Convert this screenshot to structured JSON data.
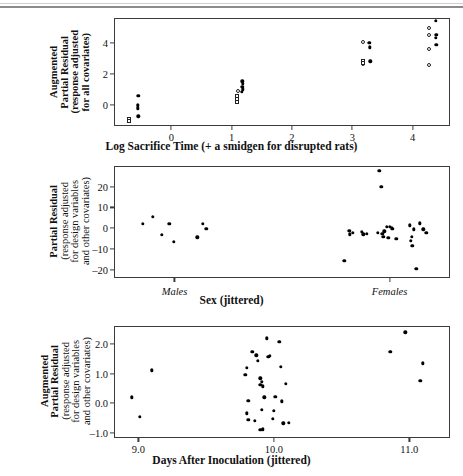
{
  "figure": {
    "background": "#ffffff",
    "axis_color": "#3b3b3b",
    "marker_color": "#000000"
  },
  "chart_data": [
    {
      "type": "scatter",
      "panel": 1,
      "title": "",
      "xlabel": "Log Sacrifice Time (+ a smidgen for disrupted rats)",
      "ylabel": "Augmented Partial Residual (response adjusted for all covariates)",
      "ylabel_lines": [
        "Augmented",
        "Partial Residual",
        "(response adjusted",
        "for all covariates)"
      ],
      "xlim": [
        -0.95,
        4.62
      ],
      "ylim": [
        -1.35,
        5.6
      ],
      "xticks": [
        0,
        1,
        2,
        3,
        4
      ],
      "xticklabels": [
        "0",
        "1",
        "2",
        "3",
        "4"
      ],
      "yticks": [
        0,
        2,
        4
      ],
      "yticklabels": [
        "0",
        "2",
        "4"
      ],
      "grid": false,
      "legend": "none",
      "series": [
        {
          "name": "filled-circle",
          "marker": "filled",
          "points": [
            [
              -0.55,
              0.58
            ],
            [
              -0.56,
              -0.02
            ],
            [
              -0.56,
              -0.22
            ],
            [
              -0.55,
              -0.72
            ],
            [
              1.18,
              1.52
            ],
            [
              1.19,
              1.36
            ],
            [
              1.18,
              1.18
            ],
            [
              1.19,
              1.02
            ],
            [
              1.17,
              0.86
            ],
            [
              3.28,
              4.02
            ],
            [
              3.29,
              3.72
            ],
            [
              3.3,
              2.82
            ],
            [
              4.38,
              5.42
            ],
            [
              4.39,
              4.52
            ],
            [
              4.38,
              4.32
            ],
            [
              4.39,
              3.88
            ]
          ]
        },
        {
          "name": "open-circle",
          "marker": "open",
          "points": [
            [
              1.1,
              0.92
            ],
            [
              3.18,
              4.04
            ],
            [
              3.17,
              2.62
            ],
            [
              4.28,
              4.96
            ],
            [
              4.27,
              4.52
            ],
            [
              4.28,
              3.58
            ],
            [
              4.27,
              2.6
            ]
          ]
        },
        {
          "name": "open-square",
          "marker": "square",
          "points": [
            [
              -0.7,
              -0.92
            ],
            [
              -0.7,
              -1.04
            ],
            [
              1.09,
              0.58
            ],
            [
              1.09,
              0.4
            ],
            [
              1.09,
              0.22
            ],
            [
              3.17,
              2.86
            ],
            [
              3.17,
              2.7
            ]
          ]
        }
      ]
    },
    {
      "type": "scatter",
      "panel": 2,
      "title": "",
      "xlabel": "Sex (jittered)",
      "ylabel": "Partial Residual (response adjusted for design variables and other covariates)",
      "ylabel_lines": [
        "Partial Residual",
        "(response adjusted",
        "for design variables",
        "and other covariates)"
      ],
      "xlim": [
        0,
        100
      ],
      "ylim": [
        -24,
        30
      ],
      "yticks": [
        20,
        10,
        0,
        -10,
        -20
      ],
      "yticklabels": [
        "20",
        "10",
        "0",
        "–10",
        "–20"
      ],
      "group_labels": [
        {
          "label": "Males",
          "x": 18
        },
        {
          "label": "Females",
          "x": 82
        }
      ],
      "xtickmarks": [
        18,
        82
      ],
      "grid": false,
      "legend": "none",
      "series": [
        {
          "name": "residuals",
          "marker": "filled",
          "points": [
            [
              8.5,
              2.0
            ],
            [
              11.5,
              5.6
            ],
            [
              14.2,
              -3.2
            ],
            [
              16.5,
              2.2
            ],
            [
              17.8,
              -6.6
            ],
            [
              26.5,
              2.2
            ],
            [
              27.5,
              -0.4
            ],
            [
              24.8,
              -4.4
            ],
            [
              70.0,
              -1.2
            ],
            [
              71.0,
              -2.2
            ],
            [
              70.2,
              -3.0
            ],
            [
              68.6,
              -15.6
            ],
            [
              73.8,
              -1.6
            ],
            [
              75.2,
              -2.8
            ],
            [
              74.2,
              -3.0
            ],
            [
              78.5,
              -2.2
            ],
            [
              79.8,
              -2.6
            ],
            [
              80.4,
              -1.4
            ],
            [
              81.2,
              0.6
            ],
            [
              82.0,
              0.8
            ],
            [
              82.6,
              0.0
            ],
            [
              83.0,
              -0.4
            ],
            [
              81.6,
              -4.6
            ],
            [
              80.2,
              -4.2
            ],
            [
              84.0,
              -5.0
            ],
            [
              79.0,
              27.6
            ],
            [
              79.6,
              20.0
            ],
            [
              88.0,
              1.4
            ],
            [
              89.2,
              -0.6
            ],
            [
              88.6,
              -4.2
            ],
            [
              88.4,
              -6.2
            ],
            [
              88.8,
              -8.4
            ],
            [
              91.0,
              2.4
            ],
            [
              92.0,
              -0.6
            ],
            [
              93.0,
              -2.2
            ],
            [
              90.0,
              -19.6
            ]
          ]
        }
      ]
    },
    {
      "type": "scatter",
      "panel": 3,
      "title": "",
      "xlabel": "Days After Inoculation (jittered)",
      "ylabel": "Augmented Partial Residual (response adjusted for design variables and other covariates)",
      "ylabel_lines": [
        "Augmented",
        "Partial Residual",
        "(response adjusted",
        "for design variables",
        "and other covariates)"
      ],
      "xlim": [
        8.82,
        11.3
      ],
      "ylim": [
        -1.18,
        2.62
      ],
      "xticks": [
        9.0,
        10.0,
        11.0
      ],
      "xticklabels": [
        "9.0",
        "10.0",
        "11.0"
      ],
      "yticks": [
        2.0,
        1.0,
        0.0,
        -1.0
      ],
      "yticklabels": [
        "2.0",
        "1.0",
        "0.0",
        "–1.0"
      ],
      "grid": false,
      "legend": "none",
      "series": [
        {
          "name": "residuals",
          "marker": "filled",
          "points": [
            [
              8.95,
              0.2
            ],
            [
              9.01,
              -0.46
            ],
            [
              9.1,
              1.12
            ],
            [
              9.8,
              1.2
            ],
            [
              9.79,
              0.96
            ],
            [
              9.81,
              0.08
            ],
            [
              9.8,
              -0.34
            ],
            [
              9.81,
              -0.56
            ],
            [
              9.84,
              1.74
            ],
            [
              9.86,
              -0.6
            ],
            [
              9.88,
              1.44
            ],
            [
              9.9,
              0.84
            ],
            [
              9.91,
              0.72
            ],
            [
              9.9,
              0.62
            ],
            [
              9.92,
              0.58
            ],
            [
              9.93,
              0.2
            ],
            [
              9.91,
              -0.22
            ],
            [
              9.9,
              -0.9
            ],
            [
              9.92,
              -0.88
            ],
            [
              9.87,
              1.62
            ],
            [
              9.95,
              2.2
            ],
            [
              9.96,
              1.58
            ],
            [
              9.97,
              1.6
            ],
            [
              9.99,
              -0.52
            ],
            [
              10.0,
              -0.26
            ],
            [
              10.01,
              0.22
            ],
            [
              10.04,
              2.08
            ],
            [
              10.05,
              1.24
            ],
            [
              10.06,
              0.06
            ],
            [
              10.07,
              -0.68
            ],
            [
              10.09,
              0.66
            ],
            [
              10.11,
              -0.66
            ],
            [
              10.86,
              1.74
            ],
            [
              10.97,
              2.4
            ],
            [
              11.1,
              1.36
            ],
            [
              11.08,
              0.76
            ]
          ]
        }
      ]
    }
  ]
}
